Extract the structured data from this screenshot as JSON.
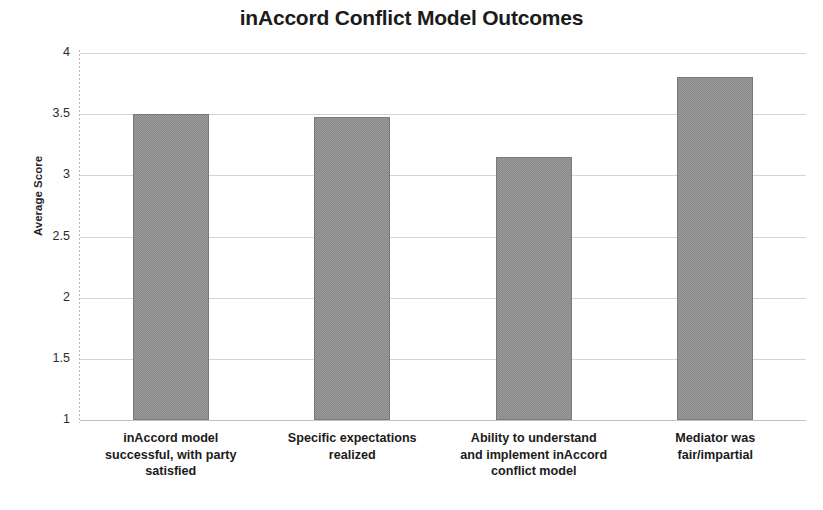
{
  "chart_data": {
    "type": "bar",
    "title": "inAccord Conflict Model Outcomes",
    "xlabel": "",
    "ylabel": "Average Score",
    "ylim": [
      1,
      4
    ],
    "yticks": [
      "1",
      "1.5",
      "2",
      "2.5",
      "3",
      "3.5",
      "4"
    ],
    "ytick_values": [
      1,
      1.5,
      2,
      2.5,
      3,
      3.5,
      4
    ],
    "grid": true,
    "legend": "none",
    "bar_color": "#848484",
    "categories": [
      "inAccord model successful, with party satisfied",
      "Specific expectations realized",
      "Ability to understand and implement inAccord conflict model",
      "Mediator was fair/impartial"
    ],
    "category_lines": [
      [
        "inAccord model",
        "successful, with party",
        "satisfied"
      ],
      [
        "Specific expectations",
        "realized"
      ],
      [
        "Ability to understand",
        "and implement inAccord",
        "conflict model"
      ],
      [
        "Mediator was",
        "fair/impartial"
      ]
    ],
    "values": [
      3.5,
      3.48,
      3.15,
      3.8
    ],
    "series": [
      {
        "name": "Average Score",
        "values": [
          3.5,
          3.48,
          3.15,
          3.8
        ]
      }
    ]
  }
}
